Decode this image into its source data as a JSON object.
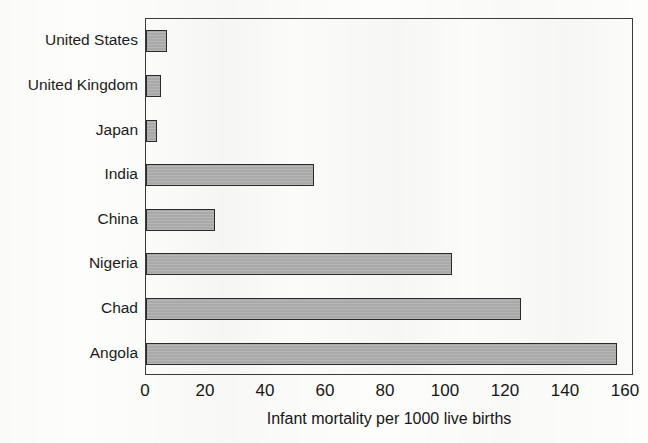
{
  "chart_data": {
    "type": "bar",
    "orientation": "horizontal",
    "title": "",
    "xlabel": "Infant mortality per 1000 live births",
    "ylabel": "",
    "categories": [
      "United States",
      "United Kingdom",
      "Japan",
      "India",
      "China",
      "Nigeria",
      "Chad",
      "Angola"
    ],
    "values": [
      7,
      5,
      3.5,
      56,
      23,
      102,
      125,
      157
    ],
    "xlim": [
      0,
      160
    ],
    "xticks": [
      0,
      20,
      40,
      60,
      80,
      100,
      120,
      140,
      160
    ],
    "xtick_labels": [
      "0",
      "20",
      "40",
      "60",
      "80",
      "100",
      "120",
      "140",
      "160"
    ],
    "grid": false,
    "legend": null,
    "bar_fill_color": "#a9a9a9",
    "bar_edge_color": "#2a2a2a",
    "frame_color": "#3a3a3a",
    "plot_background": "#fbfbfa"
  }
}
